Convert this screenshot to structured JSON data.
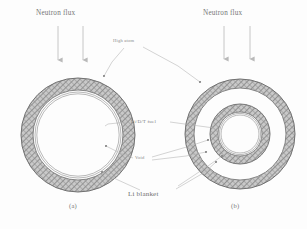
{
  "figure": {
    "caption_labels": {
      "sub_a": "(a)",
      "sub_b": "(b)"
    },
    "annotations": {
      "neutron_flux_left": "Neutron flux",
      "neutron_flux_right": "Neutron flux",
      "high_atom": "High atom",
      "fuel": "Li/D/T fuel",
      "void": "Void",
      "li_blanket": "Li blanket"
    },
    "colors": {
      "ink": "#6d6d6d",
      "hatch": "#8c8c8c",
      "hatch_fill": "#bfbfbf",
      "line": "#9a9a9a",
      "background": "#fdfdfd"
    },
    "panels": [
      {
        "id": "a",
        "label": "(a)",
        "center": [
          78,
          135
        ],
        "arrows": [
          {
            "x": 58,
            "y_start": 26,
            "y_end": 63
          },
          {
            "x": 83,
            "y_start": 26,
            "y_end": 63
          }
        ],
        "rings": [
          {
            "name": "li-blanket",
            "outer_r": 57,
            "inner_r": 45,
            "style": "hatched"
          },
          {
            "name": "void",
            "outer_r": 45,
            "inner_r": 43,
            "style": "empty"
          },
          {
            "name": "fuel-shell",
            "outer_r": 43,
            "inner_r": 41,
            "style": "thin-double-line"
          }
        ]
      },
      {
        "id": "b",
        "label": "(b)",
        "center": [
          240,
          134
        ],
        "arrows": [
          {
            "x": 224,
            "y_start": 26,
            "y_end": 62
          },
          {
            "x": 250,
            "y_start": 26,
            "y_end": 62
          }
        ],
        "rings": [
          {
            "name": "li-blanket-outer",
            "outer_r": 55,
            "inner_r": 46,
            "style": "hatched"
          },
          {
            "name": "void-outer",
            "outer_r": 46,
            "inner_r": 30,
            "style": "empty"
          },
          {
            "name": "li-blanket-inner",
            "outer_r": 30,
            "inner_r": 22,
            "style": "hatched"
          },
          {
            "name": "fuel-shell",
            "outer_r": 21,
            "inner_r": 19,
            "style": "thin-double-line"
          }
        ]
      }
    ],
    "leader_lines": [
      {
        "from": "high_atom",
        "to_panel": "a"
      },
      {
        "from": "high_atom",
        "to_panel": "b"
      },
      {
        "from": "fuel",
        "to_panel": "a"
      },
      {
        "from": "fuel",
        "to_panel": "b"
      },
      {
        "from": "void",
        "to_panel": "a"
      },
      {
        "from": "void",
        "to_panel": "b"
      },
      {
        "from": "li_blanket",
        "to_panel": "a"
      },
      {
        "from": "li_blanket",
        "to_panel": "b"
      }
    ]
  }
}
